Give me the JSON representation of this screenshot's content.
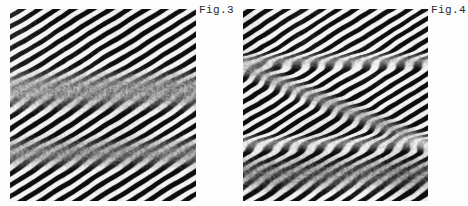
{
  "page": {
    "background_color": "#fdfdfd",
    "width": 468,
    "height": 206
  },
  "figures": [
    {
      "id": "fig3",
      "label": "Fig.3",
      "caption_position": "top-right",
      "image_kind": "hrtem-lattice-fringe-micrograph",
      "frame": {
        "x": 10,
        "y": 9,
        "width": 186,
        "height": 192
      },
      "label_position": {
        "x": 199,
        "y": 4
      },
      "fringes": {
        "orientation_deg": 58,
        "spacing_px": 9.6,
        "contrast": "high",
        "tone_dark": "#0a0a0a",
        "tone_light": "#f2f2f2"
      },
      "defects": [
        {
          "type": "horizontal-fault-band",
          "center_y_frac": 0.42,
          "thickness_frac": 0.13,
          "note": "blurred planar defect disrupting fringes"
        },
        {
          "type": "horizontal-fault-band",
          "center_y_frac": 0.74,
          "thickness_frac": 0.1,
          "note": "second weaker disrupted band lower in frame"
        },
        {
          "type": "bright-nodule",
          "x_frac": 0.56,
          "y_frac": 0.36,
          "note": "bright contrast blob at fault intersection"
        }
      ]
    },
    {
      "id": "fig4",
      "label": "Fig.4",
      "caption_position": "top-right",
      "image_kind": "hrtem-lattice-fringe-micrograph",
      "frame": {
        "x": 243,
        "y": 9,
        "width": 185,
        "height": 192
      },
      "label_position": {
        "x": 431,
        "y": 4
      },
      "fringes": {
        "orientation_deg": 58,
        "spacing_px": 9.2,
        "contrast": "high",
        "tone_dark": "#0a0a0a",
        "tone_light": "#f4f4f4"
      },
      "defects": [
        {
          "type": "horizontal-grain-boundary",
          "center_y_frac": 0.26,
          "thickness_frac": 0.05,
          "note": "sharp horizontal boundary across upper third"
        },
        {
          "type": "bright-horizontal-band",
          "center_y_frac": 0.69,
          "thickness_frac": 0.06,
          "note": "bright linear band across lower half"
        },
        {
          "type": "inclined-boundary",
          "angle_deg": 22,
          "note": "inclined interface forming Y / crossing junction with horizontal bands"
        },
        {
          "type": "disordered-region",
          "x_frac": 0.62,
          "y_frac": 0.8,
          "note": "mottled low-order region below bright band"
        }
      ]
    }
  ]
}
